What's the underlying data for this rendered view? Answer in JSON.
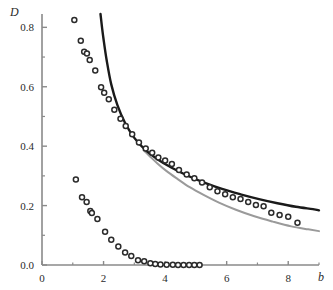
{
  "chart_data": {
    "type": "scatter",
    "title": "",
    "subtitle": "",
    "xlabel": "b",
    "ylabel": "D",
    "xlim": [
      0,
      9.0
    ],
    "ylim": [
      0.0,
      0.855
    ],
    "grid": false,
    "legend": "none",
    "x_ticks_major": [
      0,
      2,
      4,
      6,
      8
    ],
    "x_tick_labels": [
      "0",
      "2",
      "4",
      "6",
      "8"
    ],
    "x_ticks_minor": [
      1,
      3,
      5,
      7,
      9
    ],
    "y_ticks_major": [
      0.0,
      0.2,
      0.4,
      0.6,
      0.8
    ],
    "y_tick_labels": [
      "0.0",
      "0.2",
      "0.4",
      "0.6",
      "0.8"
    ],
    "y_ticks_minor": [
      0.1,
      0.3,
      0.5,
      0.7
    ],
    "axis_color": "#8a8a8a",
    "series": [
      {
        "name": "upper-scatter",
        "type": "scatter",
        "marker": "open-circle",
        "color": "#2b2b2b",
        "x": [
          1.05,
          1.26,
          1.37,
          1.46,
          1.55,
          1.73,
          1.92,
          2.02,
          2.17,
          2.35,
          2.55,
          2.72,
          2.93,
          3.15,
          3.37,
          3.58,
          3.78,
          4.0,
          4.22,
          4.45,
          4.7,
          4.95,
          5.2,
          5.45,
          5.7,
          5.95,
          6.2,
          6.45,
          6.7,
          6.95,
          7.2,
          7.45,
          7.72,
          8.0,
          8.3
        ],
        "y": [
          0.825,
          0.755,
          0.718,
          0.712,
          0.69,
          0.655,
          0.598,
          0.58,
          0.558,
          0.523,
          0.492,
          0.468,
          0.44,
          0.412,
          0.392,
          0.378,
          0.362,
          0.352,
          0.34,
          0.32,
          0.305,
          0.292,
          0.278,
          0.262,
          0.248,
          0.238,
          0.228,
          0.222,
          0.212,
          0.202,
          0.198,
          0.176,
          0.168,
          0.162,
          0.142
        ]
      },
      {
        "name": "lower-scatter",
        "type": "scatter",
        "marker": "open-circle",
        "color": "#2b2b2b",
        "x": [
          1.1,
          1.3,
          1.45,
          1.57,
          1.62,
          1.8,
          2.05,
          2.25,
          2.48,
          2.7,
          2.9,
          3.12,
          3.32,
          3.52,
          3.68,
          3.85,
          4.05,
          4.25,
          4.42,
          4.6,
          4.78,
          4.95,
          5.12
        ],
        "y": [
          0.288,
          0.228,
          0.212,
          0.182,
          0.175,
          0.155,
          0.112,
          0.085,
          0.062,
          0.042,
          0.03,
          0.016,
          0.013,
          0.006,
          0.003,
          0.002,
          0.001,
          0.001,
          0.0,
          0.0,
          0.0,
          0.0,
          0.0
        ]
      },
      {
        "name": "black-curve",
        "type": "line",
        "color": "#1a1a1a",
        "width": 2.4,
        "x": [
          1.9,
          1.95,
          2.0,
          2.1,
          2.25,
          2.45,
          2.7,
          3.0,
          3.35,
          3.75,
          4.2,
          4.7,
          5.25,
          5.85,
          6.45,
          7.05,
          7.65,
          8.25,
          8.8,
          9.0
        ],
        "y": [
          0.845,
          0.8,
          0.76,
          0.69,
          0.608,
          0.538,
          0.478,
          0.428,
          0.388,
          0.356,
          0.328,
          0.302,
          0.278,
          0.256,
          0.238,
          0.222,
          0.208,
          0.196,
          0.188,
          0.184
        ]
      },
      {
        "name": "gray-curve",
        "type": "line",
        "color": "#9a9a9a",
        "width": 2.0,
        "x": [
          3.3,
          3.5,
          3.75,
          4.05,
          4.4,
          4.8,
          5.25,
          5.75,
          6.3,
          6.9,
          7.5,
          8.1,
          8.65,
          9.0
        ],
        "y": [
          0.386,
          0.366,
          0.342,
          0.316,
          0.29,
          0.262,
          0.236,
          0.21,
          0.186,
          0.164,
          0.146,
          0.13,
          0.12,
          0.114
        ]
      }
    ]
  },
  "axes": {
    "y_axis_label": "D",
    "x_axis_label": "b"
  }
}
